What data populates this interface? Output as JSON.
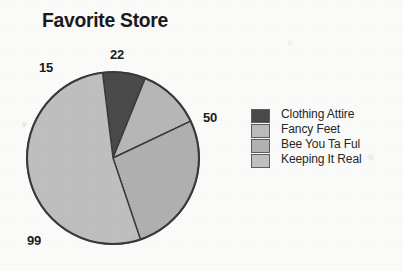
{
  "chart_data": {
    "type": "pie",
    "title": "Favorite Store",
    "categories": [
      "Clothing Attire",
      "Fancy Feet",
      "Bee You Ta Ful",
      "Keeping It Real"
    ],
    "values": [
      15,
      22,
      50,
      99
    ],
    "total": 186,
    "labels": [
      "15",
      "22",
      "50",
      "99"
    ],
    "colors": [
      "#4a4a4a",
      "#b7b7b7",
      "#b0b0b0",
      "#bfbfbf"
    ],
    "stroke": "#3a3a3a",
    "legend_position": "right",
    "grid": false,
    "xlabel": "",
    "ylabel": ""
  },
  "title": {
    "text": "Favorite Store"
  },
  "pie": {
    "center_x": 113,
    "center_y": 158,
    "radius": 86,
    "start_angle_deg": -97,
    "slices": [
      {
        "name": "Clothing Attire",
        "value": 15,
        "label": "15",
        "color": "#4a4a4a"
      },
      {
        "name": "Fancy Feet",
        "value": 22,
        "label": "22",
        "color": "#b7b7b7"
      },
      {
        "name": "Bee You Ta Ful",
        "value": 50,
        "label": "50",
        "color": "#b0b0b0"
      },
      {
        "name": "Keeping It Real",
        "value": 99,
        "label": "99",
        "color": "#bfbfbf"
      }
    ],
    "data_labels": {
      "clothing_attire": "15",
      "fancy_feet": "22",
      "bee_you_ta_ful": "50",
      "keeping_it_real": "99"
    }
  },
  "legend": {
    "items": [
      {
        "label": "Clothing Attire",
        "color": "#4a4a4a"
      },
      {
        "label": "Fancy Feet",
        "color": "#bcbcbc"
      },
      {
        "label": "Bee You Ta Ful",
        "color": "#b2b2b2"
      },
      {
        "label": "Keeping It Real",
        "color": "#c0c0c0"
      }
    ]
  }
}
